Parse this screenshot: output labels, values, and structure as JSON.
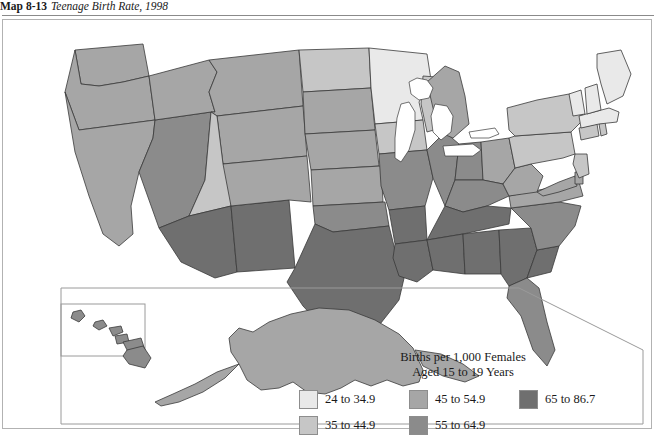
{
  "caption": {
    "number": "Map 8-13",
    "title": "Teenage Birth Rate, 1998"
  },
  "legend": {
    "title_line1": "Births per 1,000 Females",
    "title_line2": "Aged 15 to 19 Years",
    "entries": [
      {
        "label": "24 to 34.9",
        "color": "#e9e9e9"
      },
      {
        "label": "35 to 44.9",
        "color": "#c6c6c6"
      },
      {
        "label": "45 to 54.9",
        "color": "#a6a6a6"
      },
      {
        "label": "55 to 64.9",
        "color": "#8b8b8b"
      },
      {
        "label": "65 to 86.7",
        "color": "#6f6f6f"
      }
    ]
  },
  "map": {
    "stroke": "#3a3a3a",
    "water_color": "#ffffff",
    "inset_border": "#9a9a9a",
    "states": [
      {
        "abbr": "WA",
        "name": "Washington",
        "class_index": 2
      },
      {
        "abbr": "OR",
        "name": "Oregon",
        "class_index": 2
      },
      {
        "abbr": "CA",
        "name": "California",
        "class_index": 2
      },
      {
        "abbr": "NV",
        "name": "Nevada",
        "class_index": 3
      },
      {
        "abbr": "ID",
        "name": "Idaho",
        "class_index": 2
      },
      {
        "abbr": "MT",
        "name": "Montana",
        "class_index": 2
      },
      {
        "abbr": "WY",
        "name": "Wyoming",
        "class_index": 2
      },
      {
        "abbr": "UT",
        "name": "Utah",
        "class_index": 1
      },
      {
        "abbr": "AZ",
        "name": "Arizona",
        "class_index": 4
      },
      {
        "abbr": "NM",
        "name": "New Mexico",
        "class_index": 4
      },
      {
        "abbr": "CO",
        "name": "Colorado",
        "class_index": 2
      },
      {
        "abbr": "ND",
        "name": "North Dakota",
        "class_index": 1
      },
      {
        "abbr": "SD",
        "name": "South Dakota",
        "class_index": 2
      },
      {
        "abbr": "NE",
        "name": "Nebraska",
        "class_index": 2
      },
      {
        "abbr": "KS",
        "name": "Kansas",
        "class_index": 2
      },
      {
        "abbr": "OK",
        "name": "Oklahoma",
        "class_index": 3
      },
      {
        "abbr": "TX",
        "name": "Texas",
        "class_index": 4
      },
      {
        "abbr": "MN",
        "name": "Minnesota",
        "class_index": 0
      },
      {
        "abbr": "IA",
        "name": "Iowa",
        "class_index": 1
      },
      {
        "abbr": "MO",
        "name": "Missouri",
        "class_index": 3
      },
      {
        "abbr": "AR",
        "name": "Arkansas",
        "class_index": 4
      },
      {
        "abbr": "LA",
        "name": "Louisiana",
        "class_index": 4
      },
      {
        "abbr": "WI",
        "name": "Wisconsin",
        "class_index": 1
      },
      {
        "abbr": "IL",
        "name": "Illinois",
        "class_index": 3
      },
      {
        "abbr": "MI",
        "name": "Michigan",
        "class_index": 2
      },
      {
        "abbr": "IN",
        "name": "Indiana",
        "class_index": 3
      },
      {
        "abbr": "OH",
        "name": "Ohio",
        "class_index": 2
      },
      {
        "abbr": "KY",
        "name": "Kentucky",
        "class_index": 3
      },
      {
        "abbr": "TN",
        "name": "Tennessee",
        "class_index": 4
      },
      {
        "abbr": "MS",
        "name": "Mississippi",
        "class_index": 4
      },
      {
        "abbr": "AL",
        "name": "Alabama",
        "class_index": 4
      },
      {
        "abbr": "GA",
        "name": "Georgia",
        "class_index": 4
      },
      {
        "abbr": "FL",
        "name": "Florida",
        "class_index": 3
      },
      {
        "abbr": "SC",
        "name": "South Carolina",
        "class_index": 4
      },
      {
        "abbr": "NC",
        "name": "North Carolina",
        "class_index": 3
      },
      {
        "abbr": "VA",
        "name": "Virginia",
        "class_index": 2
      },
      {
        "abbr": "WV",
        "name": "West Virginia",
        "class_index": 2
      },
      {
        "abbr": "MD",
        "name": "Maryland",
        "class_index": 2
      },
      {
        "abbr": "DE",
        "name": "Delaware",
        "class_index": 2
      },
      {
        "abbr": "PA",
        "name": "Pennsylvania",
        "class_index": 1
      },
      {
        "abbr": "NJ",
        "name": "New Jersey",
        "class_index": 1
      },
      {
        "abbr": "NY",
        "name": "New York",
        "class_index": 1
      },
      {
        "abbr": "CT",
        "name": "Connecticut",
        "class_index": 1
      },
      {
        "abbr": "RI",
        "name": "Rhode Island",
        "class_index": 1
      },
      {
        "abbr": "MA",
        "name": "Massachusetts",
        "class_index": 0
      },
      {
        "abbr": "VT",
        "name": "Vermont",
        "class_index": 0
      },
      {
        "abbr": "NH",
        "name": "New Hampshire",
        "class_index": 0
      },
      {
        "abbr": "ME",
        "name": "Maine",
        "class_index": 0
      },
      {
        "abbr": "AK",
        "name": "Alaska",
        "class_index": 2
      },
      {
        "abbr": "HI",
        "name": "Hawaii",
        "class_index": 3
      }
    ]
  }
}
